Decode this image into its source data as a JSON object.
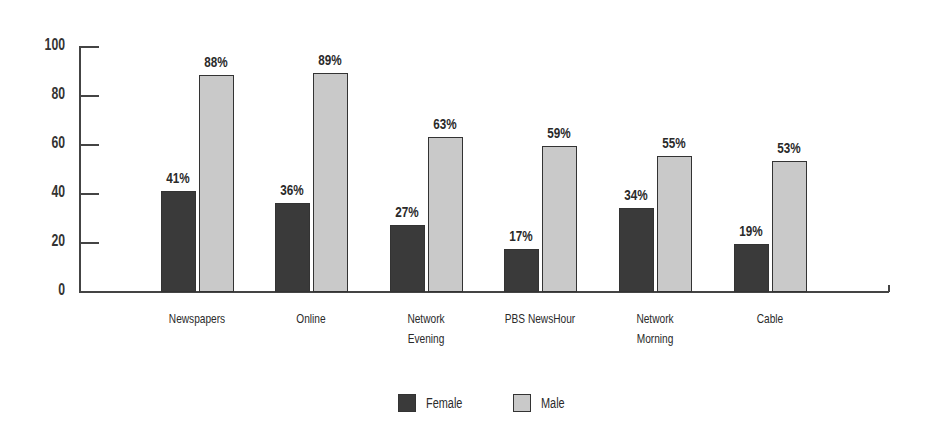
{
  "chart_data": {
    "type": "bar",
    "title": "",
    "xlabel": "",
    "ylabel": "",
    "ylim": [
      0,
      100
    ],
    "yticks": [
      0,
      20,
      40,
      60,
      80,
      100
    ],
    "grid": false,
    "legend_position": "bottom",
    "categories": [
      "Newspapers",
      "Online",
      "Network\nEvening",
      "PBS NewsHour",
      "Network\nMorning",
      "Cable"
    ],
    "series": [
      {
        "name": "Female",
        "color": "#3a3a3a",
        "values": [
          41,
          36,
          27,
          17,
          34,
          19
        ],
        "labels": [
          "41%",
          "36%",
          "27%",
          "17%",
          "34%",
          "19%"
        ]
      },
      {
        "name": "Male",
        "color": "#c9c9c9",
        "values": [
          88,
          89,
          63,
          59,
          55,
          53
        ],
        "labels": [
          "88%",
          "89%",
          "63%",
          "59%",
          "55%",
          "53%"
        ]
      }
    ]
  },
  "legend": {
    "items": [
      {
        "label": "Female",
        "color": "#3a3a3a"
      },
      {
        "label": "Male",
        "color": "#c9c9c9"
      }
    ]
  }
}
